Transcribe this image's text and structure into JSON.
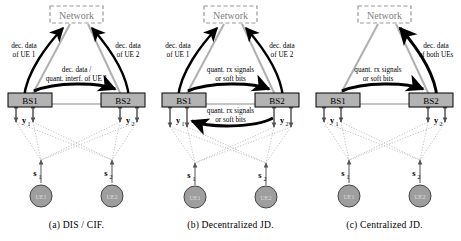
{
  "figure": {
    "panels": [
      {
        "id": "a",
        "caption": "(a) DIS / CIF.",
        "network": {
          "label": "Network"
        },
        "base_stations": [
          {
            "label": "BS1",
            "signal_label": "y",
            "signal_sub": "1"
          },
          {
            "label": "BS2",
            "signal_label": "y",
            "signal_sub": "2"
          }
        ],
        "user_equipments": [
          {
            "label": "UE1",
            "signal_label": "s",
            "signal_sub": "1"
          },
          {
            "label": "UE2",
            "signal_label": "s",
            "signal_sub": "2"
          }
        ],
        "links": {
          "left_uplink_label": [
            "dec. data",
            "of UE 1"
          ],
          "right_uplink_label": [
            "dec. data",
            "of UE 2"
          ],
          "inter_bs_label": [
            "dec. data /",
            "quant. interf. of UE 1"
          ],
          "inter_bs_label_2": [],
          "left_arrow": "black-up",
          "right_arrow": "black-up",
          "inter_bs_arrows": "single-right"
        }
      },
      {
        "id": "b",
        "caption": "(b) Decentralized JD.",
        "network": {
          "label": "Network"
        },
        "base_stations": [
          {
            "label": "BS1",
            "signal_label": "y",
            "signal_sub": "1"
          },
          {
            "label": "BS2",
            "signal_label": "y",
            "signal_sub": "2"
          }
        ],
        "user_equipments": [
          {
            "label": "UE1",
            "signal_label": "s",
            "signal_sub": "1"
          },
          {
            "label": "UE2",
            "signal_label": "s",
            "signal_sub": "2"
          }
        ],
        "links": {
          "left_uplink_label": [
            "dec. data",
            "of UE 1"
          ],
          "right_uplink_label": [
            "dec. data",
            "of UE 2"
          ],
          "inter_bs_label": [
            "quant. rx signals",
            "or soft bits"
          ],
          "inter_bs_label_2": [
            "quant. rx signals",
            "or soft bits"
          ],
          "left_arrow": "black-up",
          "right_arrow": "black-up",
          "inter_bs_arrows": "bidirectional"
        }
      },
      {
        "id": "c",
        "caption": "(c) Centralized JD.",
        "network": {
          "label": "Network"
        },
        "base_stations": [
          {
            "label": "BS1",
            "signal_label": "y",
            "signal_sub": "1"
          },
          {
            "label": "BS2",
            "signal_label": "y",
            "signal_sub": "2"
          }
        ],
        "user_equipments": [
          {
            "label": "UE1",
            "signal_label": "s",
            "signal_sub": "1"
          },
          {
            "label": "UE2",
            "signal_label": "s",
            "signal_sub": "2"
          }
        ],
        "links": {
          "left_uplink_label": [],
          "right_uplink_label": [
            "dec. data",
            "of both UEs"
          ],
          "inter_bs_label": [
            "quant. rx signals",
            "or soft bits"
          ],
          "inter_bs_label_2": [],
          "left_arrow": "none",
          "right_arrow": "black-up",
          "inter_bs_arrows": "single-right"
        }
      }
    ]
  },
  "colors": {
    "box_fill": "#b3b3b3",
    "box_stroke": "#000000",
    "network_stroke": "#999999",
    "network_text": "#808080",
    "backhaul_line": "#b0b0b0",
    "arrow_black": "#000000",
    "channel_dotted": "#bbbbbb",
    "ue_fill": "#9e9e9e"
  }
}
